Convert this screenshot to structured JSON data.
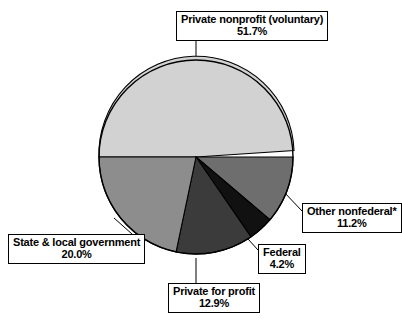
{
  "chart_data": {
    "type": "pie",
    "title": "",
    "subtitle": "",
    "legend_position": "callout-labels",
    "grid": false,
    "categories": [
      "Private nonprofit (voluntary)",
      "Other nonfederal*",
      "Federal",
      "Private for profit",
      "State & local government"
    ],
    "values": [
      51.7,
      11.2,
      4.2,
      12.9,
      20.0
    ],
    "value_suffix": "%",
    "colors": [
      "#d2d2d2",
      "#6e6e6e",
      "#111111",
      "#3b3b3b",
      "#8d8d8d"
    ],
    "slices": [
      {
        "name": "Private nonprofit (voluntary)",
        "label": "Private nonprofit (voluntary)",
        "percent_text": "51.7%",
        "value": 51.7,
        "color": "#d2d2d2",
        "start_angle": 180.0,
        "end_angle": 366.12
      },
      {
        "name": "Other nonfederal",
        "label": "Other nonfederal*",
        "percent_text": "11.2%",
        "value": 11.2,
        "color": "#6e6e6e",
        "start_angle": 0.0,
        "end_angle": 40.32
      },
      {
        "name": "Federal",
        "label": "Federal",
        "percent_text": "4.2%",
        "value": 4.2,
        "color": "#111111",
        "start_angle": 40.32,
        "end_angle": 55.44
      },
      {
        "name": "Private for profit",
        "label": "Private for profit",
        "percent_text": "12.9%",
        "value": 12.9,
        "color": "#3b3b3b",
        "start_angle": 55.44,
        "end_angle": 101.88
      },
      {
        "name": "State & local government",
        "label": "State & local government",
        "percent_text": "20.0%",
        "value": 20.0,
        "color": "#8d8d8d",
        "start_angle": 101.88,
        "end_angle": 180.0
      }
    ],
    "footnote_marker": "*",
    "outline_color": "#000000",
    "background": "#ffffff"
  }
}
